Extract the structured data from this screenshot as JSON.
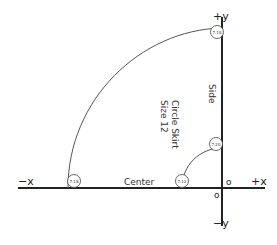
{
  "axes": {
    "pos_y": "+y",
    "neg_y": "−y",
    "pos_x": "+x",
    "neg_x": "−x",
    "origin_upper": "o",
    "origin_lower": "o"
  },
  "labels": {
    "side": "Side",
    "center": "Center",
    "title_line1": "Circle Skirt",
    "title_line2": "Size 12"
  },
  "markers": [
    {
      "id": "top",
      "value": "7.18"
    },
    {
      "id": "inner-top",
      "value": "7.20"
    },
    {
      "id": "outer-left",
      "value": "7.18"
    },
    {
      "id": "inner-left",
      "value": "7.12"
    }
  ],
  "colors": {
    "axis": "#222222",
    "arc": "#555555",
    "marker": "#444444"
  }
}
